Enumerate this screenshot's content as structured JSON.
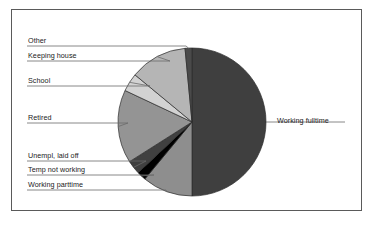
{
  "chart_data": {
    "type": "pie",
    "title": "",
    "subtitle": "",
    "xlabel": "",
    "ylabel": "",
    "legend_position": "callout-labels",
    "grid": false,
    "categories": [
      "Working fulltime",
      "Working parttime",
      "Temp not working",
      "Unempl, laid off",
      "Retired",
      "School",
      "Keeping house",
      "Other"
    ],
    "values": [
      50.0,
      11.0,
      2.0,
      3.0,
      16.0,
      4.0,
      12.5,
      1.5
    ],
    "slices": [
      {
        "label": "Working fulltime",
        "value": 50.0,
        "start_deg": 0,
        "sweep_deg": 180.0,
        "color": "#3f3f3f"
      },
      {
        "label": "Working parttime",
        "value": 11.0,
        "start_deg": 180.0,
        "sweep_deg": 39.6,
        "color": "#8e8e8e"
      },
      {
        "label": "Temp not working",
        "value": 2.0,
        "start_deg": 219.6,
        "sweep_deg": 7.2,
        "color": "#000000"
      },
      {
        "label": "Unempl, laid off",
        "value": 3.0,
        "start_deg": 226.8,
        "sweep_deg": 10.8,
        "color": "#404040"
      },
      {
        "label": "Retired",
        "value": 16.0,
        "start_deg": 237.6,
        "sweep_deg": 57.6,
        "color": "#949494"
      },
      {
        "label": "School",
        "value": 4.0,
        "start_deg": 295.2,
        "sweep_deg": 14.4,
        "color": "#d2d2d2"
      },
      {
        "label": "Keeping house",
        "value": 12.5,
        "start_deg": 309.6,
        "sweep_deg": 45.0,
        "color": "#b5b5b5"
      },
      {
        "label": "Other",
        "value": 1.5,
        "start_deg": 354.6,
        "sweep_deg": 5.4,
        "color": "#4a4a4a"
      }
    ],
    "geometry": {
      "cx": 192,
      "cy": 122,
      "r": 74
    }
  },
  "callouts": {
    "other": "Other",
    "keeping_house": "Keeping house",
    "school": "School",
    "retired": "Retired",
    "unempl": "Unempl, laid off",
    "temp_not_working": "Temp not working",
    "working_parttime": "Working parttime",
    "working_fulltime": "Working fulltime"
  },
  "style": {
    "frame_color": "#5a5a5a",
    "leader_color": "#6b6b6b",
    "text_color": "#1a1a1a",
    "background": "#ffffff"
  }
}
